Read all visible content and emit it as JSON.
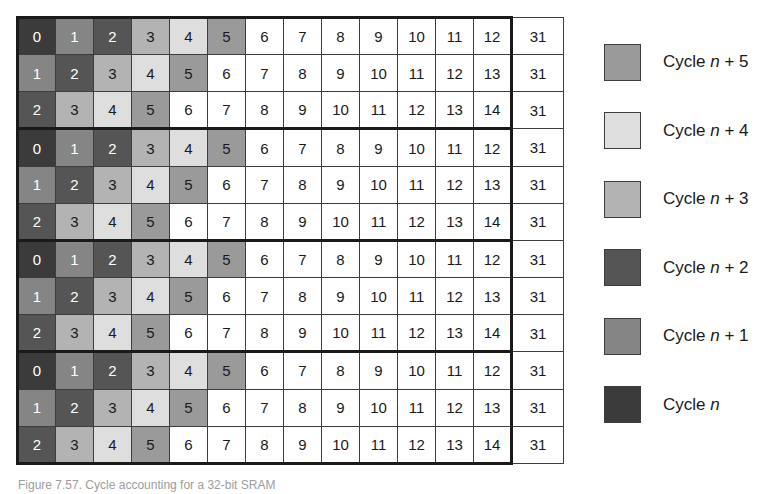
{
  "figure": {
    "caption": "Figure 7.57.  Cycle accounting for a 32-bit SRAM"
  },
  "colors": {
    "cycle_n": "#3b3b3b",
    "cycle_n_plus_1": "#858585",
    "cycle_n_plus_2": "#555555",
    "cycle_n_plus_3": "#b3b3b3",
    "cycle_n_plus_4": "#dedede",
    "cycle_n_plus_5": "#9a9a9a",
    "empty": "#ffffff",
    "grid_line": "#3d3d3d",
    "frame": "#1a1a1a"
  },
  "legend": {
    "items": [
      {
        "swatch": "c-n5",
        "prefix": "Cycle ",
        "variable": "n",
        "suffix": " + 5",
        "full": "Cycle n + 5"
      },
      {
        "swatch": "c-n4",
        "prefix": "Cycle ",
        "variable": "n",
        "suffix": " + 4",
        "full": "Cycle n + 4"
      },
      {
        "swatch": "c-n3",
        "prefix": "Cycle ",
        "variable": "n",
        "suffix": " + 3",
        "full": "Cycle n + 3"
      },
      {
        "swatch": "c-n2",
        "prefix": "Cycle ",
        "variable": "n",
        "suffix": " + 2",
        "full": "Cycle n + 2"
      },
      {
        "swatch": "c-n1",
        "prefix": "Cycle ",
        "variable": "n",
        "suffix": " + 1",
        "full": "Cycle n + 1"
      },
      {
        "swatch": "c-n",
        "prefix": "Cycle ",
        "variable": "n",
        "suffix": "",
        "full": "Cycle n"
      }
    ]
  },
  "grid": {
    "columns": 14,
    "main_columns": 13,
    "tail_column_label": "31",
    "row_groups": 4,
    "rows_per_group": 3,
    "rows": [
      {
        "group": 0,
        "pos": "top",
        "cells": [
          "0",
          "1",
          "2",
          "3",
          "4",
          "5",
          "6",
          "7",
          "8",
          "9",
          "10",
          "11",
          "12"
        ],
        "shades": [
          "c-n",
          "c-n1",
          "c-n2",
          "c-n3",
          "c-n4",
          "c-n5",
          "c-none",
          "c-none",
          "c-none",
          "c-none",
          "c-none",
          "c-none",
          "c-none"
        ],
        "tail": "31"
      },
      {
        "group": 0,
        "pos": "mid",
        "cells": [
          "1",
          "2",
          "3",
          "4",
          "5",
          "6",
          "7",
          "8",
          "9",
          "10",
          "11",
          "12",
          "13"
        ],
        "shades": [
          "c-n1",
          "c-n2",
          "c-n3",
          "c-n4",
          "c-n5",
          "c-none",
          "c-none",
          "c-none",
          "c-none",
          "c-none",
          "c-none",
          "c-none",
          "c-none"
        ],
        "tail": "31"
      },
      {
        "group": 0,
        "pos": "bot",
        "cells": [
          "2",
          "3",
          "4",
          "5",
          "6",
          "7",
          "8",
          "9",
          "10",
          "11",
          "12",
          "13",
          "14"
        ],
        "shades": [
          "c-n2",
          "c-n3",
          "c-n4",
          "c-n5",
          "c-none",
          "c-none",
          "c-none",
          "c-none",
          "c-none",
          "c-none",
          "c-none",
          "c-none",
          "c-none"
        ],
        "tail": "31"
      },
      {
        "group": 1,
        "pos": "top",
        "cells": [
          "0",
          "1",
          "2",
          "3",
          "4",
          "5",
          "6",
          "7",
          "8",
          "9",
          "10",
          "11",
          "12"
        ],
        "shades": [
          "c-n",
          "c-n1",
          "c-n2",
          "c-n3",
          "c-n4",
          "c-n5",
          "c-none",
          "c-none",
          "c-none",
          "c-none",
          "c-none",
          "c-none",
          "c-none"
        ],
        "tail": "31"
      },
      {
        "group": 1,
        "pos": "mid",
        "cells": [
          "1",
          "2",
          "3",
          "4",
          "5",
          "6",
          "7",
          "8",
          "9",
          "10",
          "11",
          "12",
          "13"
        ],
        "shades": [
          "c-n1",
          "c-n2",
          "c-n3",
          "c-n4",
          "c-n5",
          "c-none",
          "c-none",
          "c-none",
          "c-none",
          "c-none",
          "c-none",
          "c-none",
          "c-none"
        ],
        "tail": "31"
      },
      {
        "group": 1,
        "pos": "bot",
        "cells": [
          "2",
          "3",
          "4",
          "5",
          "6",
          "7",
          "8",
          "9",
          "10",
          "11",
          "12",
          "13",
          "14"
        ],
        "shades": [
          "c-n2",
          "c-n3",
          "c-n4",
          "c-n5",
          "c-none",
          "c-none",
          "c-none",
          "c-none",
          "c-none",
          "c-none",
          "c-none",
          "c-none",
          "c-none"
        ],
        "tail": "31"
      },
      {
        "group": 2,
        "pos": "top",
        "cells": [
          "0",
          "1",
          "2",
          "3",
          "4",
          "5",
          "6",
          "7",
          "8",
          "9",
          "10",
          "11",
          "12"
        ],
        "shades": [
          "c-n",
          "c-n1",
          "c-n2",
          "c-n3",
          "c-n4",
          "c-n5",
          "c-none",
          "c-none",
          "c-none",
          "c-none",
          "c-none",
          "c-none",
          "c-none"
        ],
        "tail": "31"
      },
      {
        "group": 2,
        "pos": "mid",
        "cells": [
          "1",
          "2",
          "3",
          "4",
          "5",
          "6",
          "7",
          "8",
          "9",
          "10",
          "11",
          "12",
          "13"
        ],
        "shades": [
          "c-n1",
          "c-n2",
          "c-n3",
          "c-n4",
          "c-n5",
          "c-none",
          "c-none",
          "c-none",
          "c-none",
          "c-none",
          "c-none",
          "c-none",
          "c-none"
        ],
        "tail": "31"
      },
      {
        "group": 2,
        "pos": "bot",
        "cells": [
          "2",
          "3",
          "4",
          "5",
          "6",
          "7",
          "8",
          "9",
          "10",
          "11",
          "12",
          "13",
          "14"
        ],
        "shades": [
          "c-n2",
          "c-n3",
          "c-n4",
          "c-n5",
          "c-none",
          "c-none",
          "c-none",
          "c-none",
          "c-none",
          "c-none",
          "c-none",
          "c-none",
          "c-none"
        ],
        "tail": "31"
      },
      {
        "group": 3,
        "pos": "top",
        "cells": [
          "0",
          "1",
          "2",
          "3",
          "4",
          "5",
          "6",
          "7",
          "8",
          "9",
          "10",
          "11",
          "12"
        ],
        "shades": [
          "c-n",
          "c-n1",
          "c-n2",
          "c-n3",
          "c-n4",
          "c-n5",
          "c-none",
          "c-none",
          "c-none",
          "c-none",
          "c-none",
          "c-none",
          "c-none"
        ],
        "tail": "31"
      },
      {
        "group": 3,
        "pos": "mid",
        "cells": [
          "1",
          "2",
          "3",
          "4",
          "5",
          "6",
          "7",
          "8",
          "9",
          "10",
          "11",
          "12",
          "13"
        ],
        "shades": [
          "c-n1",
          "c-n2",
          "c-n3",
          "c-n4",
          "c-n5",
          "c-none",
          "c-none",
          "c-none",
          "c-none",
          "c-none",
          "c-none",
          "c-none",
          "c-none"
        ],
        "tail": "31"
      },
      {
        "group": 3,
        "pos": "bot",
        "cells": [
          "2",
          "3",
          "4",
          "5",
          "6",
          "7",
          "8",
          "9",
          "10",
          "11",
          "12",
          "13",
          "14"
        ],
        "shades": [
          "c-n2",
          "c-n3",
          "c-n4",
          "c-n5",
          "c-none",
          "c-none",
          "c-none",
          "c-none",
          "c-none",
          "c-none",
          "c-none",
          "c-none",
          "c-none"
        ],
        "tail": "31"
      }
    ]
  }
}
